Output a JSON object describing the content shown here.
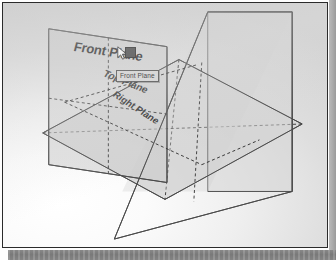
{
  "app": {
    "viewport_name": "cad-3d-viewport",
    "background_color": "#e6e6e6",
    "frame_color": "#2b2b2b"
  },
  "scene": {
    "title": "Default reference planes",
    "planes": [
      {
        "id": "front-plane",
        "label": "Front Plane",
        "orientation": "vertical-left",
        "fill": "#cfcfcf",
        "stroke": "#4a4a4a",
        "selected": true
      },
      {
        "id": "top-plane",
        "label": "Top Plane",
        "orientation": "horizontal",
        "fill": "#d8d8d8",
        "stroke": "#4a4a4a",
        "selected": false
      },
      {
        "id": "right-plane",
        "label": "Right Plane",
        "orientation": "vertical-right",
        "fill": "#d4d4d4",
        "stroke": "#4a4a4a",
        "selected": false
      }
    ],
    "hidden_edge_style": "dashed"
  },
  "tooltip": {
    "text": "Front Plane",
    "background": "#d6d6d6",
    "border": "#4a4a4a"
  },
  "cursor": {
    "icon": "arrow-pointer-icon",
    "handle_color": "#3d3d3d"
  },
  "bottom_band": {
    "name": "cropped-toolbar-strip",
    "color": "#828282"
  },
  "right_strip": {
    "name": "page-edge-strip",
    "color": "#a9a9a9"
  }
}
